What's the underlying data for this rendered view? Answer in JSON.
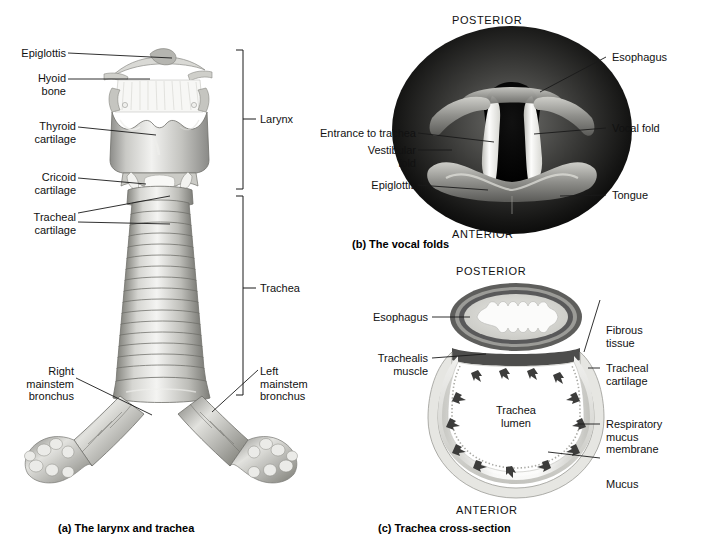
{
  "figure": {
    "panels": [
      {
        "id": "a",
        "caption": "(a) The larynx and trachea",
        "labels": [
          {
            "name": "epiglottis",
            "text": "Epiglottis"
          },
          {
            "name": "hyoid-bone",
            "text": "Hyoid\nbone"
          },
          {
            "name": "thyroid-cartilage",
            "text": "Thyroid\ncartilage"
          },
          {
            "name": "cricoid-cartilage",
            "text": "Cricoid\ncartilage"
          },
          {
            "name": "tracheal-cartilage",
            "text": "Tracheal\ncartilage"
          },
          {
            "name": "right-mainstem-bronchus",
            "text": "Right\nmainstem\nbronchus"
          },
          {
            "name": "left-mainstem-bronchus",
            "text": "Left\nmainstem\nbronchus"
          },
          {
            "name": "larynx-bracket",
            "text": "Larynx"
          },
          {
            "name": "trachea-bracket",
            "text": "Trachea"
          }
        ]
      },
      {
        "id": "b",
        "caption": "(b) The vocal folds",
        "labels": [
          {
            "name": "posterior",
            "text": "POSTERIOR"
          },
          {
            "name": "anterior",
            "text": "ANTERIOR"
          },
          {
            "name": "esophagus",
            "text": "Esophagus"
          },
          {
            "name": "vocal-fold",
            "text": "Vocal fold"
          },
          {
            "name": "entrance-to-trachea",
            "text": "Entrance to trachea"
          },
          {
            "name": "vestibular-fold",
            "text": "Vestibular\nfold"
          },
          {
            "name": "epiglottis",
            "text": "Epiglottis"
          },
          {
            "name": "tongue",
            "text": "Tongue"
          }
        ]
      },
      {
        "id": "c",
        "caption": "(c) Trachea cross-section",
        "labels": [
          {
            "name": "posterior",
            "text": "POSTERIOR"
          },
          {
            "name": "anterior",
            "text": "ANTERIOR"
          },
          {
            "name": "esophagus",
            "text": "Esophagus"
          },
          {
            "name": "trachealis-muscle",
            "text": "Trachealis\nmuscle"
          },
          {
            "name": "fibrous-tissue",
            "text": "Fibrous\ntissue"
          },
          {
            "name": "tracheal-cartilage",
            "text": "Tracheal\ncartilage"
          },
          {
            "name": "respiratory-mucus-membrane",
            "text": "Respiratory\nmucus\nmembrane"
          },
          {
            "name": "mucus",
            "text": "Mucus"
          },
          {
            "name": "trachea-lumen",
            "text": "Trachea\nlumen"
          }
        ]
      }
    ],
    "colors": {
      "leader_line": "#1a1a1a",
      "text": "#111111",
      "background": "#ffffff",
      "cartilage_light": "#e9e9e7",
      "cartilage_mid": "#b9b9b6",
      "cartilage_dark": "#7d7d7a",
      "esophagus_muscle": "#5e5e5c",
      "lumen_dark": "#0b0b0b",
      "vocal_fold_white": "#f6f6f4",
      "mucosa": "#cfcfca"
    }
  }
}
